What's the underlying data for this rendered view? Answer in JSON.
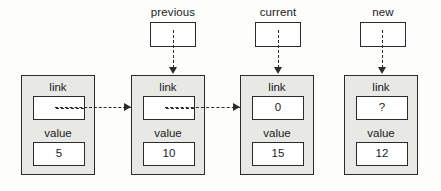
{
  "diagram": {
    "colors": {
      "node_fill": "#e8e8e4",
      "slot_fill": "#ffffff",
      "stroke": "#2b2b2b",
      "background": "#fdfdfb"
    },
    "field_labels": {
      "link": "link",
      "value": "value"
    },
    "pointers": [
      {
        "id": "previous",
        "label": "previous",
        "box_value": "",
        "x": 150,
        "y": 6,
        "target_node": 1
      },
      {
        "id": "current",
        "label": "current",
        "box_value": "",
        "x": 255,
        "y": 6,
        "target_node": 2
      },
      {
        "id": "new",
        "label": "new",
        "box_value": "",
        "x": 360,
        "y": 6,
        "target_node": 3
      }
    ],
    "nodes": [
      {
        "id": "node-0",
        "link_label": "link",
        "link_value": "",
        "link_is_pointer": true,
        "value_label": "value",
        "value": "5",
        "x": 21,
        "y": 75
      },
      {
        "id": "node-1",
        "link_label": "link",
        "link_value": "",
        "link_is_pointer": true,
        "value_label": "value",
        "value": "10",
        "x": 131,
        "y": 75
      },
      {
        "id": "node-2",
        "link_label": "link",
        "link_value": "0",
        "link_is_pointer": false,
        "value_label": "value",
        "value": "15",
        "x": 240,
        "y": 75
      },
      {
        "id": "node-3",
        "link_label": "link",
        "link_value": "?",
        "link_is_pointer": false,
        "value_label": "value",
        "value": "12",
        "x": 344,
        "y": 75
      }
    ],
    "link_arrows": [
      {
        "id": "arrow-node0-to-node1",
        "from": "node-0",
        "to": "node-1",
        "x": 55,
        "y": 107,
        "width": 83
      },
      {
        "id": "arrow-node1-to-node2",
        "from": "node-1",
        "to": "node-2",
        "x": 165,
        "y": 107,
        "width": 82
      }
    ],
    "pointer_arrows": [
      {
        "id": "arrow-previous-to-node1",
        "from": "previous",
        "to": "node-1",
        "x": 173,
        "y": 30,
        "height": 38
      },
      {
        "id": "arrow-current-to-node2",
        "from": "current",
        "to": "node-2",
        "x": 278,
        "y": 30,
        "height": 38
      },
      {
        "id": "arrow-new-to-node3",
        "from": "new",
        "to": "node-3",
        "x": 382,
        "y": 30,
        "height": 38
      }
    ]
  }
}
